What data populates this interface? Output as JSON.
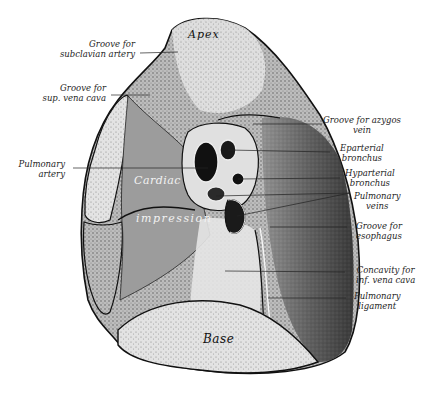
{
  "figure": {
    "regions": {
      "apex": "Apex",
      "cardiac": "Cardiac",
      "impression": "impression",
      "base": "Base"
    },
    "labels_left": [
      {
        "line1": "Groove for",
        "line2": "subclavian artery"
      },
      {
        "line1": "Groove for",
        "line2": "sup. vena cava"
      },
      {
        "line1": "Pulmonary",
        "line2": "artery"
      }
    ],
    "labels_right": [
      {
        "line1": "Groove for azygos",
        "line2": "vein"
      },
      {
        "line1": "Eparterial",
        "line2": "bronchus"
      },
      {
        "line1": "Hyparterial",
        "line2": "bronchus"
      },
      {
        "line1": "Pulmonary",
        "line2": "veins"
      },
      {
        "line1": "Groove for",
        "line2": "esophagus"
      },
      {
        "line1": "Concavity for",
        "line2": "inf. vena cava"
      },
      {
        "line1": "Pulmonary",
        "line2": "ligament"
      }
    ],
    "colors": {
      "ink": "#111111",
      "light_tissue": "#d8d8d8",
      "mid_tissue": "#8a8a8a",
      "dark_tissue": "#2a2a2a",
      "background": "#ffffff"
    }
  }
}
